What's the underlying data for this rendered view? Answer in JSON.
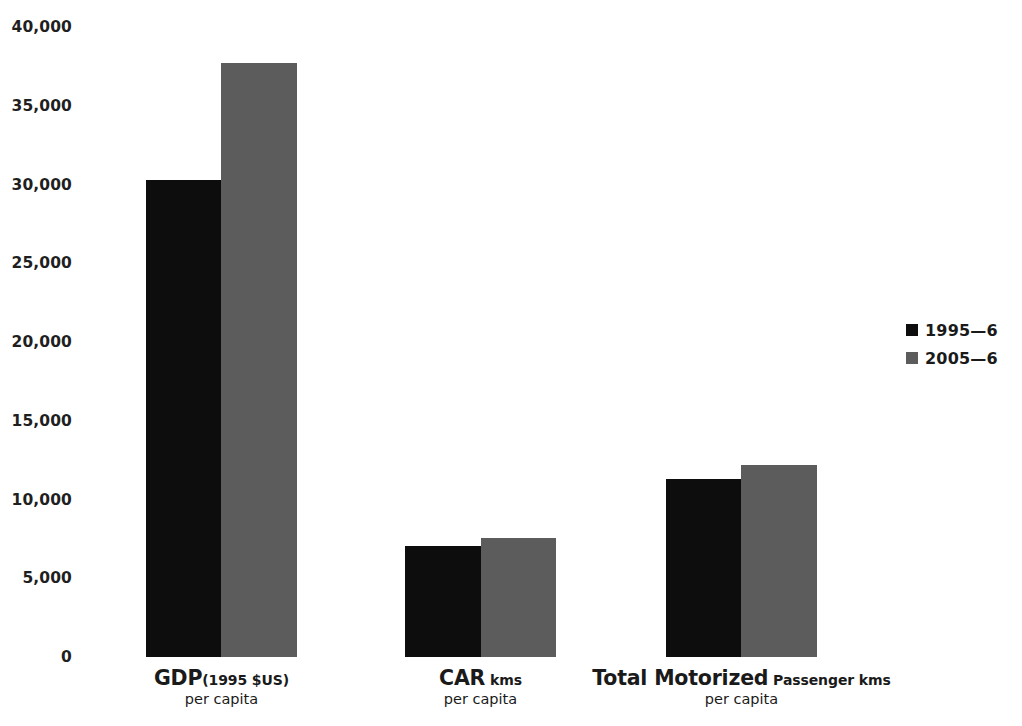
{
  "chart_data": {
    "type": "bar",
    "title": "",
    "subtitle": "",
    "xlabel": "",
    "ylabel": "",
    "ylim": [
      0,
      40000
    ],
    "ytick_step": 5000,
    "ytick_labels": [
      "40,000",
      "35,000",
      "30,000",
      "25,000",
      "20,000",
      "15,000",
      "10,000",
      "5,000",
      "0"
    ],
    "ytick_values": [
      40000,
      35000,
      30000,
      25000,
      20000,
      15000,
      10000,
      5000,
      0
    ],
    "grid": false,
    "legend_position": "right",
    "categories": [
      "GDP (1995 $US) per capita",
      "CAR kms per capita",
      "Total Motorized Passenger kms per capita"
    ],
    "category_labels": [
      {
        "main": "GDP",
        "sub": "(1995 $US)",
        "line2": "per capita"
      },
      {
        "main": "CAR",
        "sub": "kms",
        "line2": "per capita"
      },
      {
        "main": "Total Motorized",
        "sub": "Passenger kms",
        "line2": "per capita"
      }
    ],
    "series": [
      {
        "name": "1995—6",
        "color": "#0d0d0d",
        "values": [
          30300,
          7030,
          11330
        ]
      },
      {
        "name": "2005—6",
        "color": "#5c5c5c",
        "values": [
          37720,
          7530,
          12215
        ]
      }
    ]
  },
  "legend": {
    "items": [
      {
        "label": "1995—6",
        "color": "#0d0d0d"
      },
      {
        "label": "2005—6",
        "color": "#5c5c5c"
      }
    ]
  },
  "colors": {
    "background": "#ffffff",
    "text": "#1a1a1a",
    "series_1995": "#0d0d0d",
    "series_2005": "#5c5c5c"
  }
}
